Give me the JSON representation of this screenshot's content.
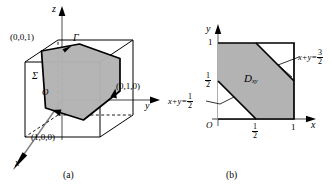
{
  "figure": {
    "panel_a": {
      "caption": "(a)",
      "axes": {
        "x": "x",
        "y": "y",
        "z": "z"
      },
      "origin_label": "O",
      "surface_label": "Σ",
      "curve_label": "Γ",
      "vertices": [
        {
          "name": "z-intercept",
          "text": "(0,0,1)"
        },
        {
          "name": "y-intercept",
          "text": "(0,1,0)"
        },
        {
          "name": "x-intercept",
          "text": "(1,0,0)"
        }
      ],
      "shade_color": "#b3b3b3",
      "line_color": "#000000"
    },
    "panel_b": {
      "caption": "(b)",
      "axes": {
        "x": "x",
        "y": "y"
      },
      "origin_label": "O",
      "region_label": "D",
      "region_sub": "xy",
      "x_ticks": [
        {
          "value": "1/2",
          "num": "1",
          "den": "2"
        },
        {
          "value": "1",
          "text": "1"
        }
      ],
      "y_ticks": [
        {
          "value": "1",
          "text": "1"
        },
        {
          "value": "1/2",
          "num": "1",
          "den": "2"
        }
      ],
      "line_lower": {
        "lhs": "x+y=",
        "num": "1",
        "den": "2"
      },
      "line_upper": {
        "lhs": "x+y=",
        "num": "3",
        "den": "2"
      },
      "shade_color": "#b3b3b3",
      "line_color": "#000000"
    }
  }
}
